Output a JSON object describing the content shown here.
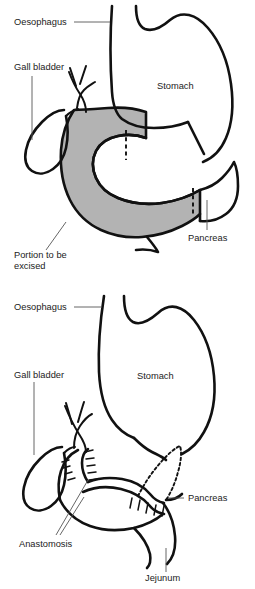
{
  "figure": {
    "background_color": "#ffffff",
    "line_color": "#111111",
    "shade_color": "#b3b3b3",
    "label_color": "#222222"
  },
  "panels": [
    {
      "id": "panel-before",
      "name": "pre-resection-diagram",
      "labels": {
        "oesophagus": "Oesophagus",
        "gall_bladder": "Gall bladder",
        "stomach": "Stomach",
        "pancreas": "Pancreas",
        "portion_line1": "Portion to be",
        "portion_line2": "excised"
      }
    },
    {
      "id": "panel-after",
      "name": "post-reconstruction-diagram",
      "labels": {
        "oesophagus": "Oesophagus",
        "gall_bladder": "Gall bladder",
        "stomach": "Stomach",
        "pancreas": "Pancreas",
        "anastomosis": "Anastomosis",
        "jejunum": "Jejunum"
      }
    }
  ]
}
